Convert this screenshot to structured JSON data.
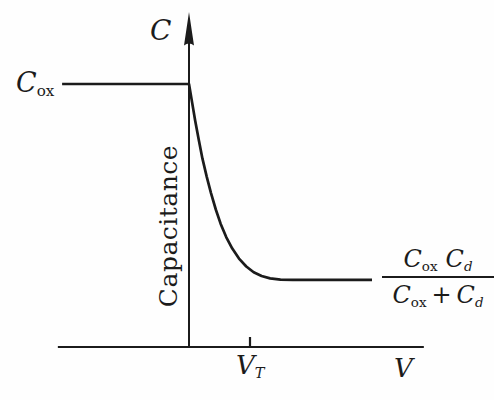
{
  "figure": {
    "background": "#fefefe",
    "ink": "#1b1b1b"
  },
  "labels": {
    "y_axis_symbol": "C",
    "y_axis_name": "Capacitance",
    "x_axis_symbol": "V",
    "cox": {
      "base": "C",
      "sub": "ox"
    },
    "vt": {
      "base": "V",
      "sub": "T"
    },
    "fraction": {
      "num": [
        {
          "base": "C",
          "sub": "ox"
        },
        {
          "base": "C",
          "sub": "d"
        }
      ],
      "den_left": {
        "base": "C",
        "sub": "ox"
      },
      "den_plus": "+",
      "den_right": {
        "base": "C",
        "sub": "d"
      }
    }
  },
  "chart_data": {
    "type": "line",
    "title": "",
    "xlabel": "V",
    "ylabel": "C",
    "ylabel_text": "Capacitance",
    "x_units": "normalized, V_T = 1",
    "y_units": "normalized, C_ox = 1",
    "xlim": [
      -2.15,
      3.85
    ],
    "ylim": [
      0,
      1.27
    ],
    "grid": false,
    "legend": false,
    "x_ticks": [
      {
        "x": 1.0,
        "label": "V_T"
      }
    ],
    "y_levels": [
      {
        "y": 1.0,
        "label": "C_ox"
      },
      {
        "y": 0.255,
        "label": "C_ox C_d / (C_ox + C_d)"
      }
    ],
    "series": [
      {
        "name": "C-V curve",
        "points": [
          [
            -2.08,
            1.0
          ],
          [
            0.0,
            1.0
          ],
          [
            0.05,
            0.93
          ],
          [
            0.1,
            0.862
          ],
          [
            0.16,
            0.787
          ],
          [
            0.22,
            0.717
          ],
          [
            0.29,
            0.648
          ],
          [
            0.36,
            0.585
          ],
          [
            0.44,
            0.523
          ],
          [
            0.52,
            0.468
          ],
          [
            0.61,
            0.418
          ],
          [
            0.71,
            0.374
          ],
          [
            0.82,
            0.336
          ],
          [
            0.94,
            0.306
          ],
          [
            1.06,
            0.284
          ],
          [
            1.19,
            0.27
          ],
          [
            1.33,
            0.261
          ],
          [
            1.5,
            0.256
          ],
          [
            1.7,
            0.255
          ],
          [
            3.0,
            0.255
          ]
        ]
      }
    ]
  }
}
